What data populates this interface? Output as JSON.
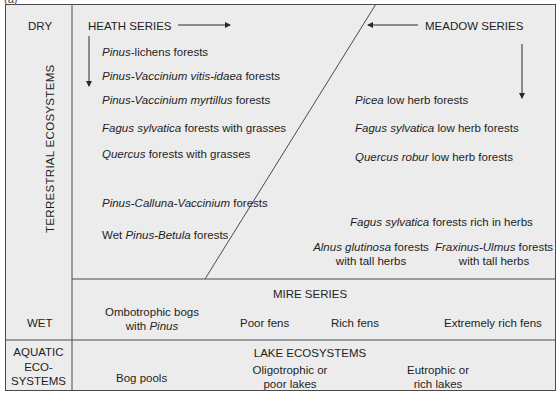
{
  "figure": {
    "label": "(a)"
  },
  "left_column": {
    "dry": "DRY",
    "terrestrial": "TERRESTRIAL ECOSYSTEMS",
    "wet": "WET",
    "aquatic_line1": "AQUATIC",
    "aquatic_line2": "ECO-",
    "aquatic_line3": "SYSTEMS"
  },
  "heath_series": {
    "title": "HEATH SERIES",
    "items": [
      {
        "italic": "Pinus",
        "rest": "-lichens forests"
      },
      {
        "italic": "Pinus-Vaccinium vitis-idaea",
        "rest": " forests"
      },
      {
        "italic": "Pinus-Vaccinium myrtillus",
        "rest": " forests"
      },
      {
        "italic": "Fagus sylvatica",
        "rest": " forests with grasses"
      },
      {
        "italic": "Quercus",
        "rest": " forests with grasses"
      },
      {
        "italic": "Pinus-Calluna-Vaccinium",
        "rest": " forests"
      },
      {
        "prefix": "Wet ",
        "italic": "Pinus-Betula",
        "rest": " forests"
      }
    ]
  },
  "meadow_series": {
    "title": "MEADOW SERIES",
    "items": [
      {
        "italic": "Picea",
        "rest": " low herb forests"
      },
      {
        "italic": "Fagus sylvatica",
        "rest": " low herb forests"
      },
      {
        "italic": "Quercus robur",
        "rest": " low herb forests"
      },
      {
        "italic": "Fagus sylvatica",
        "rest": " forests rich in herbs"
      },
      {
        "italic": "Alnus glutinosa",
        "rest": " forests",
        "line2": "with tall herbs"
      },
      {
        "italic": "Fraxinus-Ulmus",
        "rest": " forests",
        "line2": "with tall herbs"
      }
    ]
  },
  "mire_series": {
    "title": "MIRE SERIES",
    "items": [
      {
        "line1": "Ombotrophic bogs",
        "line2_prefix": "with ",
        "line2_italic": "Pinus"
      },
      {
        "line1": "Poor fens"
      },
      {
        "line1": "Rich fens"
      },
      {
        "line1": "Extremely rich fens"
      }
    ]
  },
  "lake_ecosystems": {
    "title": "LAKE ECOSYSTEMS",
    "items": [
      {
        "line1": "Bog pools"
      },
      {
        "line1": "Oligotrophic or",
        "line2": "poor lakes"
      },
      {
        "line1": "Eutrophic or",
        "line2": "rich lakes"
      }
    ]
  },
  "colors": {
    "background": "#ececec",
    "lines": "#4a4a4a",
    "text": "#1e1e1e"
  }
}
